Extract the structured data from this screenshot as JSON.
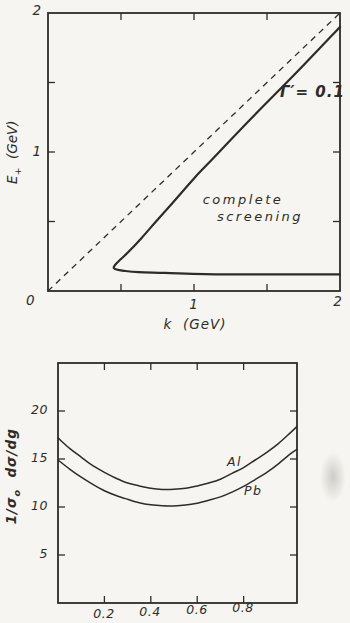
{
  "page": {
    "background": "#f6f5f1",
    "ink": "#2e2c29"
  },
  "top_chart": {
    "ylabel": {
      "sym": "E",
      "sub": "+",
      "unit": "  (GeV)"
    },
    "xlabel": "k  (GeV)",
    "origin_label": "0",
    "x_tick_labels": [
      "1",
      "2"
    ],
    "y_tick_labels": [
      "1",
      "2"
    ],
    "curve_label": "Γ′= 0.1",
    "annotation_line1": "complete",
    "annotation_line2": "screening"
  },
  "bottom_chart": {
    "ylabel": {
      "p1": "1/σ",
      "sub": "o",
      "p2": "  dσ/dg"
    },
    "y_tick_labels": [
      "20",
      "15",
      "10",
      "5"
    ],
    "x_tick_labels": [
      "0.2",
      "0.4",
      "0.6",
      "0.8"
    ],
    "series_labels": {
      "al": "Al",
      "pb": "Pb"
    }
  },
  "chart_data": [
    {
      "type": "line",
      "title": "pair energy boundary, complete screening region",
      "xlabel": "k (GeV)",
      "ylabel": "E+ (GeV)",
      "xlim": [
        0,
        2
      ],
      "ylim": [
        0,
        2
      ],
      "x_axis_labels": [
        0,
        1,
        2
      ],
      "y_axis_labels": [
        0,
        1,
        2
      ],
      "x_tick_marks": [
        0.5,
        1.0,
        1.5
      ],
      "y_tick_marks": [
        0.5,
        1.0,
        1.5
      ],
      "grid": false,
      "annotations": [
        "Γ′ = 0.1",
        "complete screening"
      ],
      "series": [
        {
          "name": "diagonal E+ = k",
          "style": "dashed",
          "points": [
            [
              0,
              0
            ],
            [
              2,
              2
            ]
          ]
        },
        {
          "name": "Γ′ = 0.1 contour",
          "style": "solid",
          "points": [
            [
              2.0,
              1.9
            ],
            [
              1.7,
              1.57
            ],
            [
              1.4,
              1.25
            ],
            [
              1.1,
              0.92
            ],
            [
              1.0,
              0.81
            ],
            [
              0.85,
              0.63
            ],
            [
              0.74,
              0.5
            ],
            [
              0.64,
              0.38
            ],
            [
              0.55,
              0.28
            ],
            [
              0.47,
              0.2
            ],
            [
              0.45,
              0.17
            ],
            [
              0.47,
              0.155
            ],
            [
              0.52,
              0.145
            ],
            [
              0.62,
              0.135
            ],
            [
              0.8,
              0.13
            ],
            [
              1.2,
              0.12
            ],
            [
              1.6,
              0.12
            ],
            [
              2.0,
              0.12
            ]
          ]
        }
      ]
    },
    {
      "type": "line",
      "title": "normalized cross section vs g for Al and Pb",
      "xlabel": "g",
      "ylabel": "1/σo dσ/dg",
      "xlim": [
        0,
        1.03
      ],
      "ylim": [
        0,
        25
      ],
      "x_tick_marks": [
        0.2,
        0.4,
        0.6,
        0.8
      ],
      "y_tick_marks": [
        5,
        10,
        15,
        20
      ],
      "grid": false,
      "legend_position": "on-curve",
      "x": [
        0,
        0.05,
        0.1,
        0.15,
        0.2,
        0.25,
        0.3,
        0.35,
        0.4,
        0.45,
        0.5,
        0.55,
        0.6,
        0.65,
        0.7,
        0.75,
        0.8,
        0.85,
        0.9,
        0.95,
        1.0,
        1.03
      ],
      "series": [
        {
          "name": "Al",
          "values": [
            17.2,
            16.1,
            15.2,
            14.3,
            13.6,
            13.0,
            12.5,
            12.2,
            11.95,
            11.83,
            11.84,
            11.95,
            12.2,
            12.5,
            12.9,
            13.5,
            14.1,
            14.9,
            15.7,
            16.6,
            17.7,
            18.4
          ]
        },
        {
          "name": "Pb",
          "values": [
            14.9,
            13.95,
            13.1,
            12.35,
            11.7,
            11.2,
            10.8,
            10.45,
            10.23,
            10.12,
            10.11,
            10.2,
            10.4,
            10.7,
            11.05,
            11.55,
            12.15,
            12.85,
            13.6,
            14.5,
            15.5,
            16.0
          ]
        }
      ]
    }
  ]
}
